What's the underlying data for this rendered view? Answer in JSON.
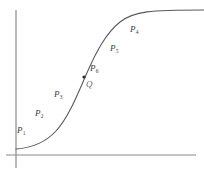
{
  "figure": {
    "axis_color": "#8a8a8a",
    "curve_color": "#5a5a5a",
    "label_color": "#3a3a3a",
    "q_color": "#6b6b6b",
    "background": "#ffffff"
  },
  "axes": {
    "y_axis": {
      "name": "y-axis",
      "x": 16,
      "y_top": 10,
      "y_bottom": 168
    },
    "x_axis": {
      "name": "x-axis",
      "y": 155,
      "x_left": 6,
      "x_right": 196
    }
  },
  "curve": {
    "name": "sigmoid-curve",
    "path": "M 16 149 C 30 148 44 144 56 131 C 68 118 76 98 86 75 C 96 52 106 33 120 22 C 134 11 150 10 204 10",
    "stroke_width": 1.1
  },
  "marker": {
    "name": "point-q-marker",
    "cx": 84,
    "cy": 77,
    "r": 1.6
  },
  "labels": [
    {
      "name": "label-p1",
      "text": "P",
      "sub": "1",
      "x": 17,
      "y": 126
    },
    {
      "name": "label-p2",
      "text": "P",
      "sub": "2",
      "x": 35,
      "y": 109
    },
    {
      "name": "label-p3",
      "text": "P",
      "sub": "3",
      "x": 54,
      "y": 90
    },
    {
      "name": "label-p6",
      "text": "P",
      "sub": "6",
      "x": 90,
      "y": 64
    },
    {
      "name": "label-p5",
      "text": "P",
      "sub": "5",
      "x": 110,
      "y": 44
    },
    {
      "name": "label-p4",
      "text": "P",
      "sub": "4",
      "x": 130,
      "y": 25
    }
  ],
  "q_label": {
    "name": "label-q",
    "text": "Q",
    "x": 86,
    "y": 80
  }
}
